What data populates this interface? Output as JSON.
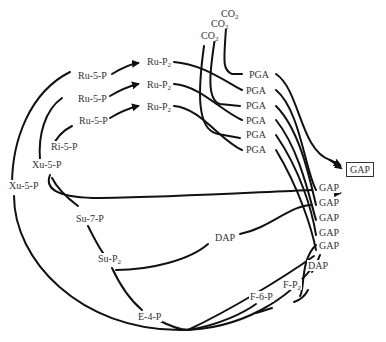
{
  "diagram": {
    "type": "Calvin cycle (carbon fixation) pathway diagram",
    "co2": [
      {
        "id": "co2_1",
        "label": "CO",
        "sub": "2"
      },
      {
        "id": "co2_2",
        "label": "CO",
        "sub": "2"
      },
      {
        "id": "co2_3",
        "label": "CO",
        "sub": "2"
      }
    ],
    "ru5p": [
      {
        "id": "ru5p_1",
        "label": "Ru-5-P"
      },
      {
        "id": "ru5p_2",
        "label": "Ru-5-P"
      },
      {
        "id": "ru5p_3",
        "label": "Ru-5-P"
      }
    ],
    "rup2": [
      {
        "id": "rup2_1",
        "label": "Ru-P",
        "sub": "2"
      },
      {
        "id": "rup2_2",
        "label": "Ru-P",
        "sub": "2"
      },
      {
        "id": "rup2_3",
        "label": "Ru-P",
        "sub": "2"
      }
    ],
    "pga": [
      {
        "id": "pga_1",
        "label": "PGA"
      },
      {
        "id": "pga_2",
        "label": "PGA"
      },
      {
        "id": "pga_3",
        "label": "PGA"
      },
      {
        "id": "pga_4",
        "label": "PGA"
      },
      {
        "id": "pga_5",
        "label": "PGA"
      },
      {
        "id": "pga_6",
        "label": "PGA"
      }
    ],
    "gap_output": {
      "label": "GAP"
    },
    "gap": [
      {
        "id": "gap_1",
        "label": "GAP"
      },
      {
        "id": "gap_2",
        "label": "GAP"
      },
      {
        "id": "gap_3",
        "label": "GAP"
      },
      {
        "id": "gap_4",
        "label": "GAP"
      },
      {
        "id": "gap_5",
        "label": "GAP"
      }
    ],
    "others": {
      "ri5p": "Ri-5-P",
      "xu5p_inner": "Xu-5-P",
      "xu5p_outer": "Xu-5-P",
      "su7p": "Su-7-P",
      "sup2": {
        "label": "Su-P",
        "sub": "2"
      },
      "dap_mid": "DAP",
      "dap_right": "DAP",
      "fp2": {
        "label": "F-P",
        "sub": "2"
      },
      "f6p": "F-6-P",
      "e4p": "E-4-P"
    }
  }
}
